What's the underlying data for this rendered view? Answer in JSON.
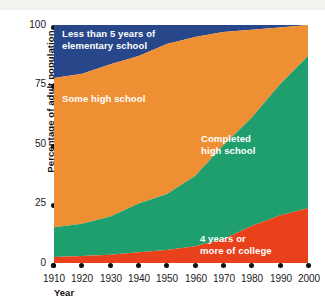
{
  "chart_data": {
    "type": "area",
    "stacked": true,
    "title": "",
    "subtitle": "",
    "xlabel": "Year",
    "ylabel": "Percentage of adult population",
    "xlim": [
      1910,
      2000
    ],
    "ylim": [
      0,
      100
    ],
    "grid": false,
    "legend_position": "inline-annotations",
    "xticks": [
      "1910",
      "1920",
      "1930",
      "1940",
      "1950",
      "1960",
      "1970",
      "1980",
      "1990",
      "2000"
    ],
    "yticks": [
      "0",
      "25",
      "50",
      "75",
      "100"
    ],
    "x": [
      1910,
      1920,
      1930,
      1940,
      1950,
      1960,
      1970,
      1980,
      1990,
      2000
    ],
    "series": [
      {
        "name": "4 years or more of college",
        "color": "#e8411c",
        "values": [
          2.5,
          3.0,
          3.5,
          4.5,
          5.5,
          7.0,
          10.0,
          15.5,
          20.0,
          23.0
        ]
      },
      {
        "name": "Completed high school",
        "color": "#1f9e6e",
        "values": [
          12.5,
          13.5,
          16.0,
          20.5,
          23.5,
          29.5,
          39.5,
          45.5,
          55.0,
          64.0
        ]
      },
      {
        "name": "Some high school",
        "color": "#ef8f34",
        "values": [
          62.7,
          63.0,
          64.0,
          62.0,
          63.0,
          58.5,
          47.5,
          37.0,
          24.0,
          13.0
        ]
      },
      {
        "name": "Less than 5 years of elementary school",
        "color": "#27478a",
        "values": [
          22.3,
          20.5,
          16.5,
          13.0,
          8.0,
          5.0,
          3.0,
          2.0,
          1.0,
          0.0
        ]
      }
    ],
    "cumulative_tops": {
      "red": [
        2.5,
        3.0,
        3.5,
        4.5,
        5.5,
        7.0,
        10.0,
        15.5,
        20.0,
        23.0
      ],
      "green": [
        15.0,
        16.5,
        19.5,
        25.0,
        29.0,
        36.5,
        49.5,
        61.0,
        75.0,
        87.0
      ],
      "orange": [
        77.7,
        79.5,
        83.5,
        87.0,
        92.0,
        95.0,
        97.0,
        98.0,
        99.0,
        100.0
      ],
      "blue": [
        100,
        100,
        100,
        100,
        100,
        100,
        100,
        100,
        100,
        100
      ]
    },
    "annotations": [
      {
        "name": "blue-band-label",
        "text": "Less than 5 years of\nelementary school",
        "color": "#ffffff"
      },
      {
        "name": "orange-band-label",
        "text": "Some high school",
        "color": "#ffffff"
      },
      {
        "name": "green-band-label",
        "text": "Completed\nhigh school",
        "color": "#ffffff"
      },
      {
        "name": "red-band-label",
        "text": "4 years or\nmore of college",
        "color": "#ffffff"
      }
    ]
  },
  "axes": {
    "y_title": "Percentage of adult population",
    "x_title": "Year",
    "y_ticks": [
      {
        "label": "100",
        "value": 100
      },
      {
        "label": "75",
        "value": 75
      },
      {
        "label": "50",
        "value": 50
      },
      {
        "label": "25",
        "value": 25
      },
      {
        "label": "0",
        "value": 0
      }
    ],
    "x_ticks": [
      {
        "label": "1910",
        "value": 1910
      },
      {
        "label": "1920",
        "value": 1920
      },
      {
        "label": "1930",
        "value": 1930
      },
      {
        "label": "1940",
        "value": 1940
      },
      {
        "label": "1950",
        "value": 1950
      },
      {
        "label": "1960",
        "value": 1960
      },
      {
        "label": "1970",
        "value": 1970
      },
      {
        "label": "1980",
        "value": 1980
      },
      {
        "label": "1990",
        "value": 1990
      },
      {
        "label": "2000",
        "value": 2000
      }
    ]
  },
  "bands": {
    "blue": {
      "label": "Less than 5 years of\nelementary school",
      "color": "#27478a"
    },
    "orange": {
      "label": "Some high school",
      "color": "#ef8f34"
    },
    "green": {
      "label": "Completed\nhigh school",
      "color": "#1f9e6e"
    },
    "red": {
      "label": "4 years or\nmore of college",
      "color": "#e8411c"
    }
  }
}
